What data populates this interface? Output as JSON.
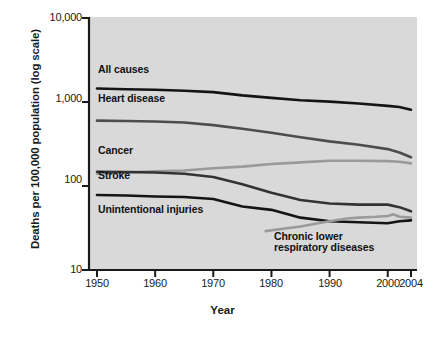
{
  "chart_data": {
    "type": "line",
    "title": "",
    "xlabel": "Year",
    "ylabel": "Deaths per 100,000 population (log scale)",
    "yscale": "log",
    "ylim": [
      10,
      10000
    ],
    "xlim": [
      1950,
      2004
    ],
    "grid": false,
    "legend_position": "inline-labels",
    "yticks": [
      10,
      100,
      1000,
      10000
    ],
    "ytick_labels": [
      "10",
      "100",
      "1,000",
      "10,000"
    ],
    "xticks": [
      1950,
      1960,
      1970,
      1980,
      1990,
      2000,
      2004
    ],
    "xtick_labels": [
      "1950",
      "1960",
      "1970",
      "1980",
      "1990",
      "2000",
      "2004"
    ],
    "series": [
      {
        "name": "All causes",
        "color": "#141414",
        "width": 2.6,
        "x": [
          1950,
          1955,
          1960,
          1965,
          1970,
          1975,
          1980,
          1985,
          1990,
          1995,
          2000,
          2002,
          2004
        ],
        "values": [
          1446,
          1420,
          1400,
          1360,
          1310,
          1200,
          1120,
          1050,
          1010,
          960,
          900,
          870,
          810
        ]
      },
      {
        "name": "Heart disease",
        "color": "#4d4d4d",
        "width": 2.6,
        "x": [
          1950,
          1955,
          1960,
          1965,
          1970,
          1975,
          1980,
          1985,
          1990,
          1995,
          2000,
          2002,
          2004
        ],
        "values": [
          600,
          595,
          585,
          570,
          530,
          480,
          430,
          380,
          340,
          310,
          275,
          250,
          220
        ]
      },
      {
        "name": "Cancer",
        "color": "#9a9a9a",
        "width": 2.6,
        "x": [
          1950,
          1955,
          1960,
          1965,
          1970,
          1975,
          1980,
          1985,
          1990,
          1995,
          2000,
          2002,
          2004
        ],
        "values": [
          140,
          145,
          150,
          153,
          163,
          170,
          183,
          191,
          200,
          200,
          198,
          194,
          186
        ]
      },
      {
        "name": "Stroke",
        "color": "#333333",
        "width": 2.6,
        "x": [
          1950,
          1955,
          1960,
          1965,
          1970,
          1975,
          1980,
          1985,
          1990,
          1995,
          2000,
          2002,
          2004
        ],
        "values": [
          148,
          147,
          145,
          140,
          128,
          105,
          83,
          68,
          62,
          60,
          60,
          56,
          50
        ]
      },
      {
        "name": "Unintentional injuries",
        "color": "#141414",
        "width": 2.6,
        "x": [
          1950,
          1955,
          1960,
          1965,
          1970,
          1975,
          1980,
          1985,
          1990,
          1995,
          2000,
          2002,
          2004
        ],
        "values": [
          78,
          77,
          75,
          74,
          70,
          57,
          52,
          42,
          38,
          37,
          36,
          38,
          39
        ]
      },
      {
        "name": "Chronic lower respiratory diseases",
        "color": "#9a9a9a",
        "width": 2.6,
        "x": [
          1979,
          1982,
          1985,
          1988,
          1990,
          1993,
          1995,
          1998,
          2000,
          2001,
          2002,
          2004
        ],
        "values": [
          29,
          31,
          33,
          36,
          38,
          41,
          42,
          43,
          44,
          46,
          43,
          42
        ]
      }
    ],
    "annotations": [
      {
        "text": "All causes",
        "x": 1951.5,
        "y": 2000
      },
      {
        "text": "Heart disease",
        "x": 1951.5,
        "y": 820
      },
      {
        "text": "Cancer",
        "x": 1951.5,
        "y": 250
      },
      {
        "text": "Stroke",
        "x": 1951.5,
        "y": 118
      },
      {
        "text": "Unintentional injuries",
        "x": 1951.5,
        "y": 58
      },
      {
        "text": "Chronic lower respiratory diseases",
        "x": 1985,
        "y": 22
      }
    ],
    "plot_background": "#d9d9d9",
    "axis_color": "#1a1a1a"
  },
  "labels": {
    "y_axis_title": "Deaths per 100,000 population (log scale)",
    "x_axis_title": "Year",
    "ytick_0": "10,000",
    "ytick_1": "1,000",
    "ytick_2": "100",
    "ytick_3": "10",
    "xtick_0": "1950",
    "xtick_1": "1960",
    "xtick_2": "1970",
    "xtick_3": "1980",
    "xtick_4": "1990",
    "xtick_5": "2000",
    "xtick_6": "2004",
    "series_all_causes": "All causes",
    "series_heart_disease": "Heart disease",
    "series_cancer": "Cancer",
    "series_stroke": "Stroke",
    "series_unintentional": "Unintentional injuries",
    "series_clrd_line1": "Chronic lower",
    "series_clrd_line2": "respiratory diseases"
  },
  "footer": {
    "partial_caption": ""
  }
}
